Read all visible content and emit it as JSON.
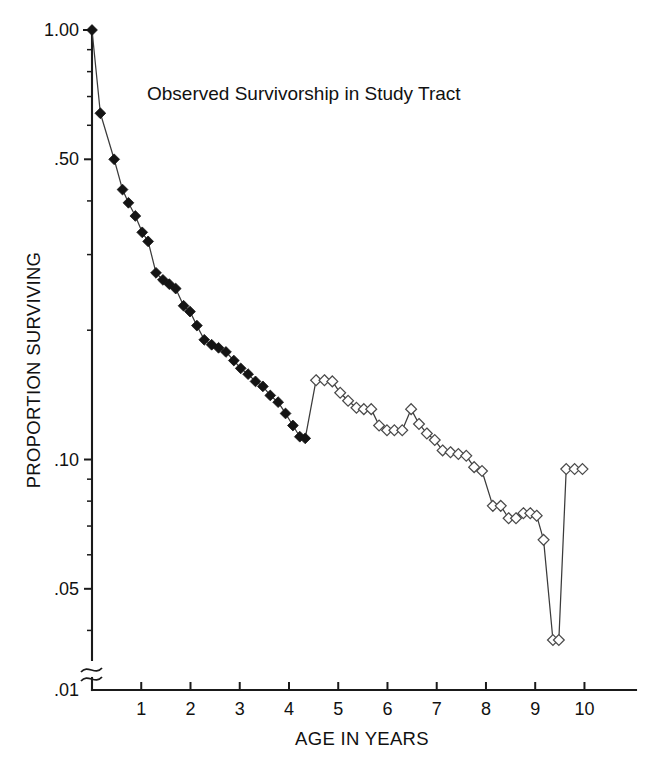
{
  "chart_data": {
    "type": "line",
    "title": "Observed Survivorship in Study Tract",
    "xlabel": "AGE IN YEARS",
    "ylabel": "PROPORTION SURVIVING",
    "yscale": "log",
    "ylim": [
      0.01,
      1.0
    ],
    "xlim": [
      0,
      10.6
    ],
    "grid": false,
    "legend": null,
    "axis_break": {
      "axis": "y",
      "between": [
        0.01,
        0.038
      ],
      "symbol": "double-slash"
    },
    "y_ticks_major": [
      "1.00",
      ".50",
      ".10",
      ".05",
      ".01"
    ],
    "y_ticks_major_values": [
      1.0,
      0.5,
      0.1,
      0.05,
      0.01
    ],
    "y_ticks_minor_values": [
      0.9,
      0.8,
      0.7,
      0.6,
      0.4,
      0.3,
      0.2,
      0.09,
      0.08,
      0.07,
      0.06,
      0.04,
      0.03,
      0.02
    ],
    "x_ticks": [
      "1",
      "2",
      "3",
      "4",
      "5",
      "6",
      "7",
      "8",
      "9",
      "10"
    ],
    "x_ticks_values": [
      1,
      2,
      3,
      4,
      5,
      6,
      7,
      8,
      9,
      10
    ],
    "series": [
      {
        "name": "Observed survivorship (early, filled markers)",
        "marker": "filled-diamond",
        "marker_color": "#141414",
        "points": [
          {
            "x": 0.0,
            "y": 1.0
          },
          {
            "x": 0.17,
            "y": 0.64
          },
          {
            "x": 0.45,
            "y": 0.5
          },
          {
            "x": 0.62,
            "y": 0.425
          },
          {
            "x": 0.74,
            "y": 0.396
          },
          {
            "x": 0.88,
            "y": 0.369
          },
          {
            "x": 1.02,
            "y": 0.338
          },
          {
            "x": 1.14,
            "y": 0.322
          },
          {
            "x": 1.3,
            "y": 0.272
          },
          {
            "x": 1.44,
            "y": 0.262
          },
          {
            "x": 1.57,
            "y": 0.256
          },
          {
            "x": 1.7,
            "y": 0.25
          },
          {
            "x": 1.86,
            "y": 0.228
          },
          {
            "x": 1.99,
            "y": 0.221
          },
          {
            "x": 2.13,
            "y": 0.205
          },
          {
            "x": 2.28,
            "y": 0.19
          },
          {
            "x": 2.43,
            "y": 0.185
          },
          {
            "x": 2.57,
            "y": 0.182
          },
          {
            "x": 2.72,
            "y": 0.178
          },
          {
            "x": 2.88,
            "y": 0.17
          },
          {
            "x": 3.02,
            "y": 0.163
          },
          {
            "x": 3.17,
            "y": 0.158
          },
          {
            "x": 3.32,
            "y": 0.152
          },
          {
            "x": 3.47,
            "y": 0.148
          },
          {
            "x": 3.62,
            "y": 0.141
          },
          {
            "x": 3.78,
            "y": 0.136
          },
          {
            "x": 3.93,
            "y": 0.128
          },
          {
            "x": 4.08,
            "y": 0.12
          },
          {
            "x": 4.22,
            "y": 0.113
          },
          {
            "x": 4.33,
            "y": 0.112
          }
        ]
      },
      {
        "name": "Observed survivorship (later, open markers)",
        "marker": "open-diamond",
        "marker_color": "#ffffff",
        "points": [
          {
            "x": 4.55,
            "y": 0.153
          },
          {
            "x": 4.72,
            "y": 0.153
          },
          {
            "x": 4.88,
            "y": 0.152
          },
          {
            "x": 5.04,
            "y": 0.143
          },
          {
            "x": 5.2,
            "y": 0.137
          },
          {
            "x": 5.37,
            "y": 0.132
          },
          {
            "x": 5.52,
            "y": 0.131
          },
          {
            "x": 5.67,
            "y": 0.131
          },
          {
            "x": 5.83,
            "y": 0.12
          },
          {
            "x": 5.99,
            "y": 0.117
          },
          {
            "x": 6.14,
            "y": 0.117
          },
          {
            "x": 6.3,
            "y": 0.117
          },
          {
            "x": 6.48,
            "y": 0.131
          },
          {
            "x": 6.64,
            "y": 0.121
          },
          {
            "x": 6.8,
            "y": 0.115
          },
          {
            "x": 6.96,
            "y": 0.111
          },
          {
            "x": 7.12,
            "y": 0.105
          },
          {
            "x": 7.28,
            "y": 0.104
          },
          {
            "x": 7.44,
            "y": 0.103
          },
          {
            "x": 7.6,
            "y": 0.102
          },
          {
            "x": 7.76,
            "y": 0.096
          },
          {
            "x": 7.92,
            "y": 0.094
          },
          {
            "x": 8.14,
            "y": 0.078
          },
          {
            "x": 8.3,
            "y": 0.078
          },
          {
            "x": 8.46,
            "y": 0.073
          },
          {
            "x": 8.61,
            "y": 0.073
          },
          {
            "x": 8.76,
            "y": 0.075
          },
          {
            "x": 8.9,
            "y": 0.075
          },
          {
            "x": 9.03,
            "y": 0.074
          },
          {
            "x": 9.17,
            "y": 0.065
          },
          {
            "x": 9.36,
            "y": 0.038
          },
          {
            "x": 9.48,
            "y": 0.038
          },
          {
            "x": 9.63,
            "y": 0.095
          },
          {
            "x": 9.8,
            "y": 0.095
          },
          {
            "x": 9.96,
            "y": 0.095
          }
        ]
      }
    ]
  }
}
